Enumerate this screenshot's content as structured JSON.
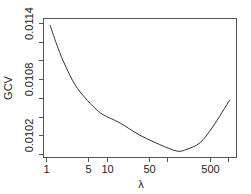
{
  "chart_data": {
    "type": "line",
    "title": "",
    "xlabel": "λ",
    "ylabel": "GCV",
    "xscale": "log",
    "xlim": [
      1,
      1300
    ],
    "ylim": [
      0.009967,
      0.01145
    ],
    "grid": false,
    "legend": null,
    "x_ticks": [
      1,
      5,
      10,
      50,
      100,
      500,
      1000
    ],
    "x_tick_labels": [
      "1",
      "5",
      "10",
      "50",
      "",
      "500",
      ""
    ],
    "y_ticks": [
      0.01,
      0.0102,
      0.0104,
      0.0106,
      0.0108,
      0.011,
      0.0112,
      0.0114
    ],
    "y_tick_labels": [
      "",
      "0.0102",
      "",
      "",
      "0.0108",
      "",
      "",
      "0.0114"
    ],
    "series": [
      {
        "name": "GCV",
        "x": [
          1.16,
          1.58,
          2.06,
          3.0,
          4.4,
          6.4,
          8.7,
          16.6,
          35.3,
          75,
          144,
          210,
          345,
          560,
          1070
        ],
        "y": [
          0.01138,
          0.01113,
          0.01095,
          0.01074,
          0.0106,
          0.01049,
          0.01042,
          0.01033,
          0.0102,
          0.0101,
          0.01003,
          0.01005,
          0.01012,
          0.01029,
          0.01058
        ]
      }
    ]
  },
  "labels": {
    "xlabel": "λ",
    "ylabel": "GCV"
  }
}
